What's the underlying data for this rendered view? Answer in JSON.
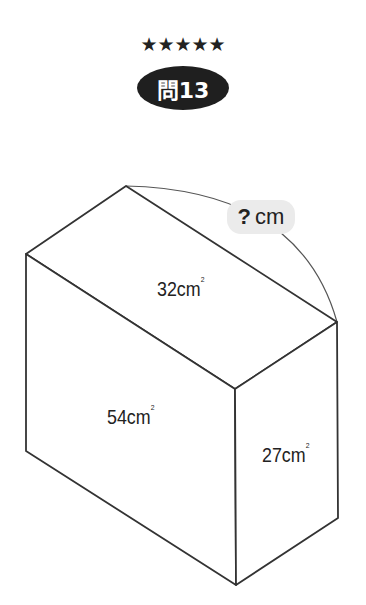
{
  "header": {
    "difficulty_stars": "★★★★★",
    "difficulty_rating": 5,
    "problem_label": "問13"
  },
  "figure": {
    "type": "rectangular prism (cuboid)",
    "faces": {
      "top": {
        "area": "32",
        "unit": "cm",
        "unit_sup": "2"
      },
      "front": {
        "area": "54",
        "unit": "cm",
        "unit_sup": "2"
      },
      "side": {
        "area": "27",
        "unit": "cm",
        "unit_sup": "2"
      }
    },
    "unknown": {
      "symbol": "?",
      "unit": "cm",
      "description": "length of top back edge"
    },
    "colors": {
      "line": "#333333",
      "badge_bg": "#1f1f1f",
      "unknown_bg": "#ebebeb"
    }
  }
}
